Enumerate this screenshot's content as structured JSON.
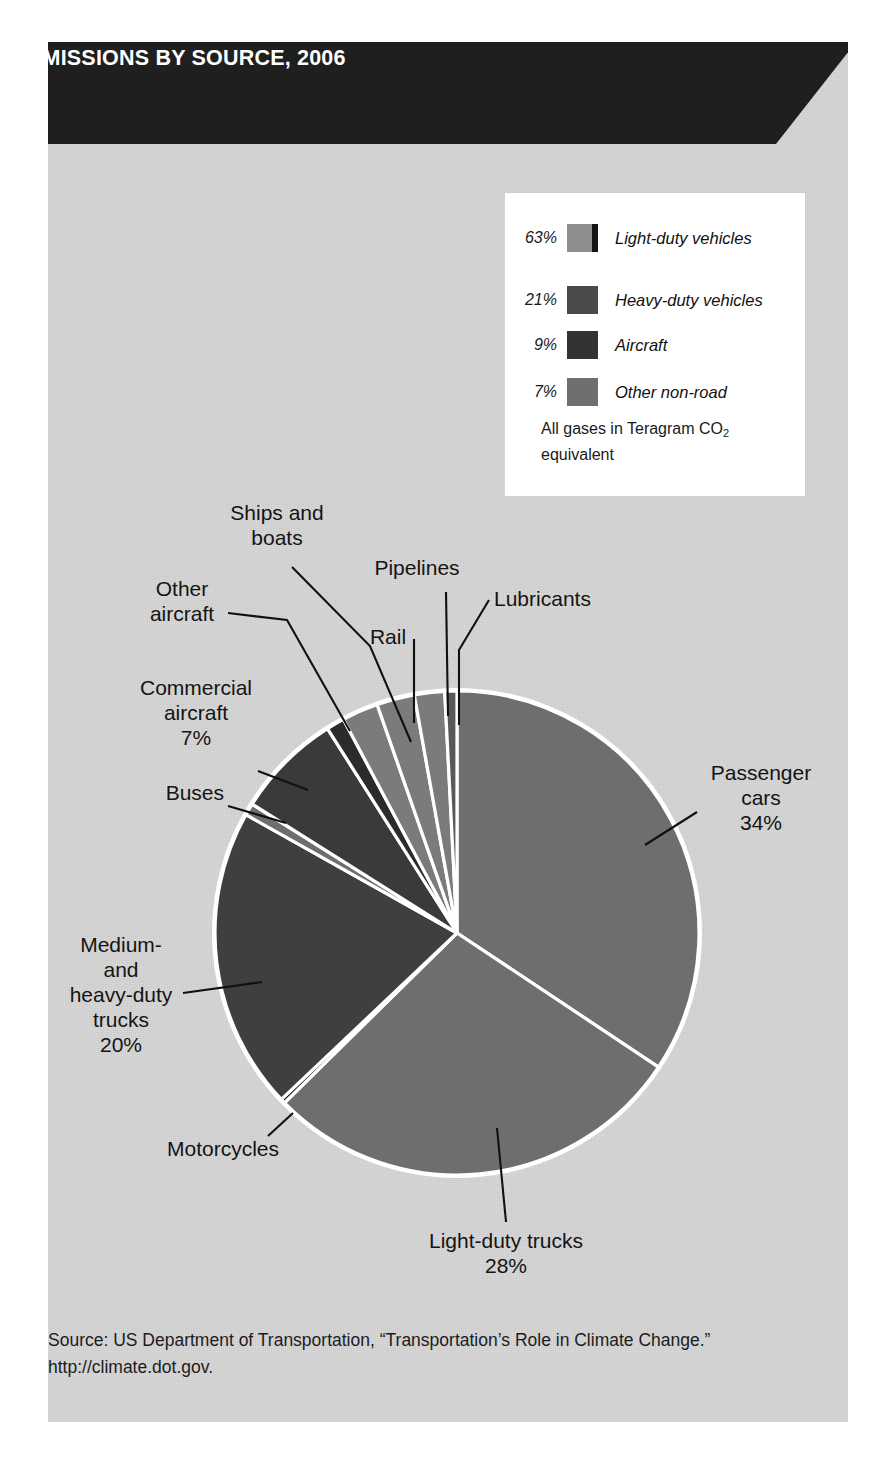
{
  "banner": {
    "line1": "US TRANSPORTATION GREENHOUSE GAS",
    "line2": "EMISSIONS BY SOURCE, 2006"
  },
  "legend": {
    "items": [
      {
        "pct": "63%",
        "label": "Light-duty vehicles",
        "color": "#8e8e8e",
        "striped": true
      },
      {
        "pct": "21%",
        "label": "Heavy-duty vehicles",
        "color": "#4a4a4a",
        "striped": false
      },
      {
        "pct": "9%",
        "label": "Aircraft",
        "color": "#333333",
        "striped": false
      },
      {
        "pct": "7%",
        "label": "Other non-road",
        "color": "#6f6f6f",
        "striped": false
      }
    ],
    "note_line1": "All gases in Teragram CO",
    "note_sub": "2",
    "note_line2": "equivalent"
  },
  "callouts": {
    "ships_and_boats": "Ships and\nboats",
    "pipelines": "Pipelines",
    "other_aircraft": "Other\naircraft",
    "rail": "Rail",
    "lubricants": "Lubricants",
    "commercial_aircraft": "Commercial\naircraft\n7%",
    "buses": "Buses",
    "passenger_cars": "Passenger\ncars\n34%",
    "medium_heavy_trucks": "Medium-\nand\nheavy-duty\ntrucks\n20%",
    "motorcycles": "Motorcycles",
    "light_duty_trucks": "Light-duty trucks\n28%"
  },
  "source": {
    "line1": "Source: US Department of Transportation, “Transportation’s Role in Climate Change.”",
    "line2": "http://climate.dot.gov."
  },
  "chart_data": {
    "type": "pie",
    "title": "US Transportation Greenhouse Gas Emissions by Source, 2006",
    "unit": "Teragram CO2 equivalent",
    "legend_position": "top-right",
    "grid": false,
    "categories": [
      "Passenger cars",
      "Light-duty trucks",
      "Motorcycles",
      "Medium- and heavy-duty trucks",
      "Buses",
      "Commercial aircraft",
      "Other aircraft",
      "Ships and boats",
      "Rail",
      "Pipelines",
      "Lubricants"
    ],
    "values": [
      34,
      28,
      0.3,
      20,
      0.8,
      7,
      1.2,
      2.4,
      2.5,
      2.0,
      0.8
    ],
    "labels": [
      "34%",
      "28%",
      "",
      "20%",
      "",
      "7%",
      "",
      "",
      "",
      "",
      ""
    ],
    "colors": [
      "#6e6e6e",
      "#6e6e6e",
      "#151515",
      "#3f3f3f",
      "#6e6e6e",
      "#3a3a3a",
      "#2b2b2b",
      "#7b7b7b",
      "#7b7b7b",
      "#7b7b7b",
      "#585858"
    ],
    "start_angle_deg": 0,
    "direction": "clockwise",
    "slice_border": "#ffffff",
    "legend_groups": [
      {
        "label": "Light-duty vehicles",
        "pct": 63
      },
      {
        "label": "Heavy-duty vehicles",
        "pct": 21
      },
      {
        "label": "Aircraft",
        "pct": 9
      },
      {
        "label": "Other non-road",
        "pct": 7
      }
    ]
  },
  "geometry": {
    "center_x": 457,
    "center_y": 933,
    "radius": 242
  }
}
